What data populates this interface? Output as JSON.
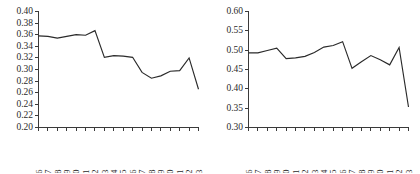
{
  "figure": {
    "background_color": "#ffffff",
    "line_color": "#2a2a2a",
    "axis_color": "#3a3a3a",
    "panel_count": 2
  },
  "chart_data": [
    {
      "type": "line",
      "title": "",
      "subtitle": "",
      "xlabel": "",
      "ylabel": "",
      "grid": false,
      "legend": false,
      "legend_position": "none",
      "panel": "left",
      "x": [
        1996,
        1997,
        1998,
        1999,
        2000,
        2001,
        2002,
        2003,
        2004,
        2005,
        2006,
        2007,
        2008,
        2009,
        2010,
        2011,
        2012,
        2013
      ],
      "xtick_labels": [
        "1996",
        "1997",
        "1998",
        "1999",
        "2000",
        "2001",
        "2002",
        "2003",
        "2004",
        "2005",
        "2006",
        "2007",
        "2008",
        "2009",
        "2010",
        "2011",
        "2012",
        "2013"
      ],
      "values": [
        0.358,
        0.357,
        0.354,
        0.357,
        0.36,
        0.359,
        0.367,
        0.321,
        0.324,
        0.323,
        0.321,
        0.295,
        0.285,
        0.289,
        0.297,
        0.298,
        0.32,
        0.266
      ],
      "ylim": [
        0.2,
        0.4
      ],
      "yticks": [
        0.2,
        0.22,
        0.24,
        0.26,
        0.28,
        0.3,
        0.32,
        0.34,
        0.36,
        0.38,
        0.4
      ],
      "ytick_labels": [
        "0.20",
        "0.22",
        "0.24",
        "0.26",
        "0.28",
        "0.30",
        "0.32",
        "0.34",
        "0.36",
        "0.38",
        "0.40"
      ],
      "ytick_step": 0.02
    },
    {
      "type": "line",
      "title": "",
      "subtitle": "",
      "xlabel": "",
      "ylabel": "",
      "grid": false,
      "legend": false,
      "legend_position": "none",
      "panel": "right",
      "x": [
        1996,
        1997,
        1998,
        1999,
        2000,
        2001,
        2002,
        2003,
        2004,
        2005,
        2006,
        2007,
        2008,
        2009,
        2010,
        2011,
        2012,
        2013
      ],
      "xtick_labels": [
        "1996",
        "1997",
        "1998",
        "1999",
        "2000",
        "2001",
        "2002",
        "2003",
        "2004",
        "2005",
        "2006",
        "2007",
        "2008",
        "2009",
        "2010",
        "2011",
        "2012",
        "2013"
      ],
      "values": [
        0.493,
        0.493,
        0.499,
        0.505,
        0.478,
        0.48,
        0.484,
        0.494,
        0.508,
        0.512,
        0.522,
        0.453,
        0.47,
        0.486,
        0.475,
        0.462,
        0.507,
        0.353
      ],
      "ylim": [
        0.3,
        0.6
      ],
      "yticks": [
        0.3,
        0.35,
        0.4,
        0.45,
        0.5,
        0.55,
        0.6
      ],
      "ytick_labels": [
        "0.30",
        "0.35",
        "0.40",
        "0.45",
        "0.50",
        "0.55",
        "0.60"
      ],
      "ytick_step": 0.05
    }
  ]
}
